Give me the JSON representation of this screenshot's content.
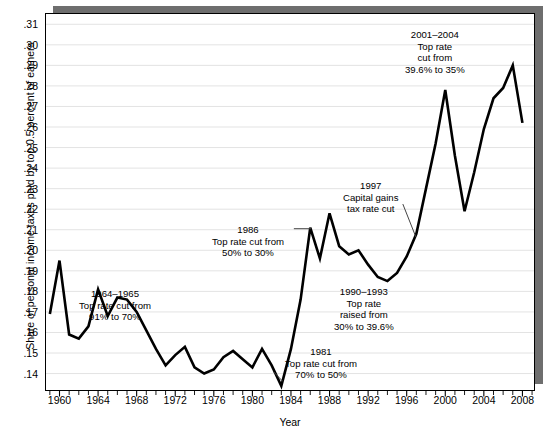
{
  "chart_data": {
    "type": "line",
    "title": "",
    "xlabel": "Year",
    "ylabel": "Share of personal income taxes paid by top 0.5 percent of earners",
    "xlim": [
      1958.6,
      2009.2
    ],
    "ylim": [
      0.132,
      0.315
    ],
    "grid": true,
    "legend": null,
    "x_major_ticks": [
      1960,
      1964,
      1968,
      1972,
      1976,
      1980,
      1984,
      1988,
      1992,
      1996,
      2000,
      2004,
      2008
    ],
    "x_major_tick_labels": [
      "1960",
      "1964",
      "1968",
      "1972",
      "1976",
      "1980",
      "1984",
      "1988",
      "1992",
      "1996",
      "2000",
      "2004",
      "2008"
    ],
    "x_minor_tick_step": 1,
    "y_ticks": [
      0.14,
      0.15,
      0.16,
      0.17,
      0.18,
      0.19,
      0.2,
      0.21,
      0.22,
      0.23,
      0.24,
      0.25,
      0.26,
      0.27,
      0.28,
      0.29,
      0.3,
      0.31
    ],
    "y_tick_labels": [
      ".14",
      ".15",
      ".16",
      ".17",
      ".18",
      ".19",
      ".20",
      ".21",
      ".22",
      ".23",
      ".24",
      ".25",
      ".26",
      ".27",
      ".28",
      ".29",
      ".30",
      ".31"
    ],
    "series": [
      {
        "name": "Share of personal income taxes paid by top 0.5 percent of earners",
        "color": "#000000",
        "x": [
          1959,
          1960,
          1961,
          1962,
          1963,
          1964,
          1965,
          1966,
          1967,
          1968,
          1969,
          1970,
          1971,
          1972,
          1973,
          1974,
          1975,
          1976,
          1977,
          1978,
          1979,
          1980,
          1981,
          1982,
          1983,
          1984,
          1985,
          1986,
          1987,
          1988,
          1989,
          1990,
          1991,
          1992,
          1993,
          1994,
          1995,
          1996,
          1997,
          1998,
          1999,
          2000,
          2001,
          2002,
          2003,
          2004,
          2005,
          2006,
          2007,
          2008
        ],
        "y": [
          0.169,
          0.195,
          0.159,
          0.157,
          0.163,
          0.181,
          0.168,
          0.177,
          0.176,
          0.17,
          0.161,
          0.152,
          0.144,
          0.149,
          0.153,
          0.143,
          0.14,
          0.142,
          0.148,
          0.151,
          0.147,
          0.143,
          0.152,
          0.144,
          0.134,
          0.152,
          0.176,
          0.211,
          0.196,
          0.218,
          0.202,
          0.198,
          0.2,
          0.193,
          0.187,
          0.185,
          0.189,
          0.197,
          0.208,
          0.23,
          0.252,
          0.278,
          0.246,
          0.219,
          0.238,
          0.259,
          0.274,
          0.279,
          0.29,
          0.262
        ]
      }
    ],
    "annotations": [
      {
        "id": "ann-1964",
        "lines": [
          "1964–1965",
          "Top rate cut from",
          "91% to 70%"
        ],
        "x_px": 79,
        "y_px": 288,
        "leader": null
      },
      {
        "id": "ann-1981",
        "lines": [
          "1981",
          "Top rate cut from",
          "70% to 50%"
        ],
        "x_px": 285,
        "y_px": 346,
        "leader": "diagonal"
      },
      {
        "id": "ann-1986",
        "lines": [
          "1986",
          "Top rate cut from",
          "50% to 30%"
        ],
        "x_px": 212,
        "y_px": 224,
        "leader": "horizontal"
      },
      {
        "id": "ann-1990",
        "lines": [
          "1990–1993",
          "Top rate",
          "raised from",
          "30% to 39.6%"
        ],
        "x_px": 334,
        "y_px": 286,
        "leader": null
      },
      {
        "id": "ann-1997",
        "lines": [
          "1997",
          "Capital gains",
          "tax rate cut"
        ],
        "x_px": 343,
        "y_px": 180,
        "leader": "diagonal"
      },
      {
        "id": "ann-2001",
        "lines": [
          "2001–2004",
          "Top rate",
          "cut from",
          "39.6% to 35%"
        ],
        "x_px": 405,
        "y_px": 29,
        "leader": null
      }
    ]
  },
  "style": {
    "line_color": "#000000",
    "grid_color": "#e3e3e3",
    "frame_color": "#000000",
    "shadow_color": "#6e6e6e",
    "background": "#ffffff"
  }
}
